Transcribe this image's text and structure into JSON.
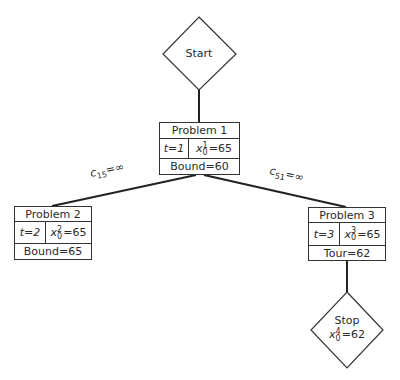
{
  "start_node": {
    "label": "Start"
  },
  "problems": [
    {
      "title": "Problem 1",
      "t": "t=1",
      "x_sup": "1",
      "x_sub": "0",
      "x_value": "=65",
      "footer": "Bound=60"
    },
    {
      "title": "Problem 2",
      "t": "t=2",
      "x_sup": "2",
      "x_sub": "0",
      "x_value": "=65",
      "footer": "Bound=65"
    },
    {
      "title": "Problem 3",
      "t": "t=3",
      "x_sup": "3",
      "x_sub": "0",
      "x_value": "=65",
      "footer": "Tour=62"
    }
  ],
  "edges": [
    {
      "var": "c",
      "sub": "15",
      "value": "=∞"
    },
    {
      "var": "c",
      "sub": "51",
      "value": "=∞"
    }
  ],
  "stop_node": {
    "label": "Stop",
    "x_sup": "4",
    "x_sub": "0",
    "x_value": "=62"
  }
}
